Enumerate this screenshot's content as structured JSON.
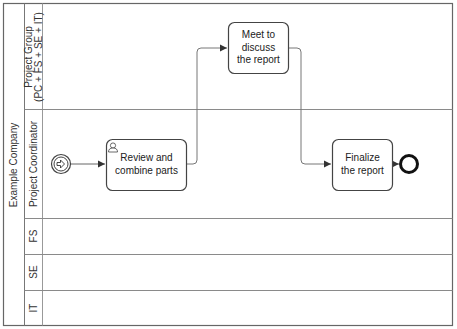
{
  "pool": {
    "label": "Example Company"
  },
  "lanes": [
    {
      "id": "project-group",
      "label_line1": "Project Group",
      "label_line2": "(PC + FS + SE + IT)"
    },
    {
      "id": "project-coordinator",
      "label": "Project Coordinator"
    },
    {
      "id": "fs",
      "label": "FS"
    },
    {
      "id": "se",
      "label": "SE"
    },
    {
      "id": "it",
      "label": "IT"
    }
  ],
  "events": {
    "start": {
      "type": "start-message-event",
      "icon": "arrow-right-icon"
    },
    "end": {
      "type": "end-event"
    }
  },
  "tasks": [
    {
      "id": "review",
      "line1": "Review and",
      "line2": "combine parts",
      "icon": "user-icon",
      "lane": "Project Coordinator"
    },
    {
      "id": "meet",
      "line1": "Meet to",
      "line2": "discuss",
      "line3": "the report",
      "lane": "Project Group (PC + FS + SE + IT)"
    },
    {
      "id": "finalize",
      "line1": "Finalize",
      "line2": "the report",
      "lane": "Project Coordinator"
    }
  ],
  "flows": [
    {
      "from": "start",
      "to": "review"
    },
    {
      "from": "review",
      "to": "meet"
    },
    {
      "from": "meet",
      "to": "finalize"
    },
    {
      "from": "finalize",
      "to": "end"
    }
  ],
  "colors": {
    "stroke": "#555555",
    "lane_line": "#8a8a8a",
    "text": "#333333"
  }
}
